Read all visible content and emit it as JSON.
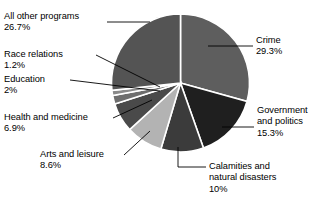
{
  "chart_data": {
    "type": "pie",
    "title": "",
    "subtitle": "",
    "xlabel": "",
    "ylabel": "",
    "legend_position": "callout-labels",
    "grid": false,
    "start_angle_deg": 0,
    "direction": "clockwise",
    "units": "percent",
    "categories": [
      "Crime",
      "Government and politics",
      "Calamities and natural disasters",
      "Arts and leisure",
      "Health and medicine",
      "Education",
      "Race relations",
      "All other programs"
    ],
    "values": [
      29.3,
      15.3,
      10,
      8.6,
      6.9,
      2,
      1.2,
      26.7
    ],
    "value_labels": [
      "29.3%",
      "15.3%",
      "10%",
      "8.6%",
      "6.9%",
      "2%",
      "1.2%",
      "26.7%"
    ],
    "colors": [
      "#5e5e5e",
      "#1f1f1f",
      "#3b3b3b",
      "#b3b3b3",
      "#4a4a4a",
      "#6e6e6e",
      "#8a8a8a",
      "#545454"
    ],
    "slice_edge_color": "#ffffff",
    "background_color": "#ffffff",
    "slices": [
      {
        "label": "Crime",
        "value": 29.3,
        "value_label": "29.3%",
        "color": "#5e5e5e"
      },
      {
        "label": "Government and politics",
        "value": 15.3,
        "value_label": "15.3%",
        "color": "#1f1f1f"
      },
      {
        "label": "Calamities and natural disasters",
        "value": 10,
        "value_label": "10%",
        "color": "#3b3b3b"
      },
      {
        "label": "Arts and leisure",
        "value": 8.6,
        "value_label": "8.6%",
        "color": "#b3b3b3"
      },
      {
        "label": "Health and medicine",
        "value": 6.9,
        "value_label": "6.9%",
        "color": "#4a4a4a"
      },
      {
        "label": "Education",
        "value": 2,
        "value_label": "2%",
        "color": "#6e6e6e"
      },
      {
        "label": "Race relations",
        "value": 1.2,
        "value_label": "1.2%",
        "color": "#8a8a8a"
      },
      {
        "label": "All other programs",
        "value": 26.7,
        "value_label": "26.7%",
        "color": "#545454"
      }
    ]
  },
  "callouts": {
    "all_other_programs": {
      "name": "All other programs",
      "pct": "26.7%"
    },
    "race_relations": {
      "name": "Race relations",
      "pct": "1.2%"
    },
    "education": {
      "name": "Education",
      "pct": "2%"
    },
    "health_and_medicine": {
      "name": "Health and medicine",
      "pct": "6.9%"
    },
    "arts_and_leisure": {
      "name": "Arts and leisure",
      "pct": "8.6%"
    },
    "crime": {
      "name": "Crime",
      "pct": "29.3%"
    },
    "government_and_politics": {
      "name_line1": "Government",
      "name_line2": "and politics",
      "pct": "15.3%"
    },
    "calamities": {
      "name_line1": "Calamities and",
      "name_line2": "natural disasters",
      "pct": "10%"
    }
  }
}
